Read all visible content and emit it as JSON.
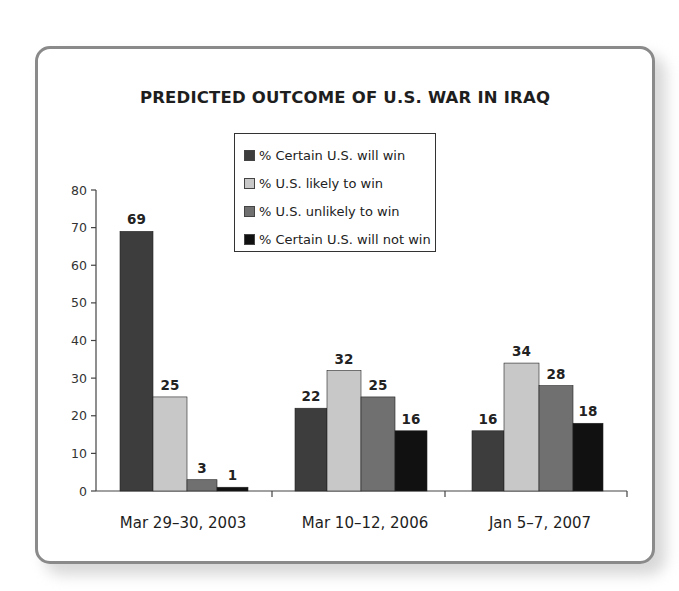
{
  "chart_data": {
    "type": "bar",
    "title": "PREDICTED OUTCOME OF U.S. WAR IN IRAQ",
    "xlabel": "",
    "ylabel": "",
    "ylim": [
      0,
      80
    ],
    "yticks": [
      0,
      10,
      20,
      30,
      40,
      50,
      60,
      70,
      80
    ],
    "grid": false,
    "legend_position": "top-center (boxed)",
    "categories": [
      "Mar 29–30, 2003",
      "Mar 10–12, 2006",
      "Jan 5–7, 2007"
    ],
    "series": [
      {
        "name": "% Certain U.S. will win",
        "color": "#3d3d3d",
        "values": [
          69,
          22,
          16
        ]
      },
      {
        "name": "% U.S. likely to win",
        "color": "#c8c8c8",
        "values": [
          25,
          32,
          34
        ]
      },
      {
        "name": "% U.S. unlikely to win",
        "color": "#707070",
        "values": [
          3,
          25,
          28
        ]
      },
      {
        "name": "% Certain U.S. will not win",
        "color": "#111111",
        "values": [
          1,
          16,
          18
        ]
      }
    ],
    "data_labels": true
  },
  "legend": {
    "items": [
      {
        "label": "% Certain U.S. will win",
        "color": "#3d3d3d"
      },
      {
        "label": "% U.S. likely to win",
        "color": "#c8c8c8"
      },
      {
        "label": "% U.S. unlikely to win",
        "color": "#707070"
      },
      {
        "label": "% Certain U.S. will not win",
        "color": "#111111"
      }
    ]
  },
  "card": {
    "border_color": "#8a8a8a"
  }
}
